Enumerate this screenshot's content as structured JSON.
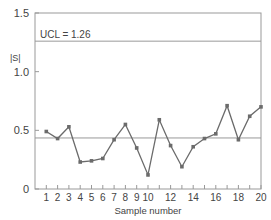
{
  "chart_data": {
    "type": "line",
    "title": "",
    "xlabel": "Sample number",
    "ylabel": "|S|",
    "xlim": [
      0,
      20
    ],
    "ylim": [
      0,
      1.5
    ],
    "x_ticks": [
      1,
      2,
      3,
      4,
      5,
      6,
      7,
      8,
      9,
      10,
      11,
      12,
      13,
      14,
      15,
      16,
      17,
      18,
      19,
      20
    ],
    "x_tick_labels": [
      "1",
      "2",
      "3",
      "4",
      "5",
      "6",
      "7",
      "8",
      "9",
      "10",
      "12",
      "14",
      "16",
      "18",
      "20"
    ],
    "x_tick_label_positions": [
      1,
      2,
      3,
      4,
      5,
      6,
      7,
      8,
      9,
      10,
      12,
      14,
      16,
      18,
      20
    ],
    "y_ticks": [
      0,
      0.5,
      1.0,
      1.5
    ],
    "y_tick_labels": [
      "0",
      "0.5",
      "1.0",
      "1.5"
    ],
    "grid": false,
    "x": [
      1,
      2,
      3,
      4,
      5,
      6,
      7,
      8,
      9,
      10,
      11,
      12,
      13,
      14,
      15,
      16,
      17,
      18,
      19,
      20
    ],
    "series": [
      {
        "name": "|S|",
        "values": [
          0.49,
          0.43,
          0.53,
          0.23,
          0.24,
          0.26,
          0.42,
          0.55,
          0.35,
          0.12,
          0.59,
          0.37,
          0.19,
          0.36,
          0.43,
          0.47,
          0.71,
          0.42,
          0.62,
          0.7
        ]
      }
    ],
    "reference_lines": [
      {
        "name": "UCL",
        "value": 1.26,
        "label": "UCL = 1.26"
      },
      {
        "name": "CL",
        "value": 0.435,
        "label": ""
      }
    ],
    "colors": {
      "line": "#6b6b6b",
      "marker": "#6b6b6b",
      "axis": "#999999",
      "reference": "#999999",
      "text": "#444444"
    }
  }
}
